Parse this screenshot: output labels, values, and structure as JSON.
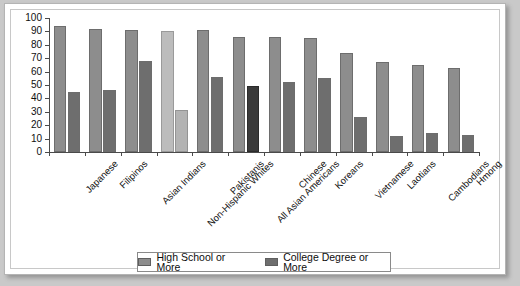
{
  "chart_data": {
    "type": "bar",
    "title": "",
    "xlabel": "",
    "ylabel": "",
    "ylim": [
      0,
      100
    ],
    "ytick_step": 10,
    "yticks": [
      "0",
      "10",
      "20",
      "30",
      "40",
      "50",
      "60",
      "70",
      "80",
      "90",
      "100"
    ],
    "grid": false,
    "legend_position": "bottom",
    "categories": [
      "Japanese",
      "Filipinos",
      "Asian Indians",
      "Non-Hispanic Whites",
      "Pakistanis",
      "All Asian Americans",
      "Chinese",
      "Koreans",
      "Vietnamese",
      "Laotians",
      "Cambodians",
      "Hmong"
    ],
    "series": [
      {
        "name": "High School or More",
        "color": "#8d8d8d",
        "values": [
          94,
          92,
          91,
          90,
          91,
          86,
          86,
          85,
          74,
          67,
          65,
          63
        ]
      },
      {
        "name": "College Degree or More",
        "color": "#6e6e6e",
        "values": [
          45,
          46,
          68,
          31,
          56,
          49,
          52,
          55,
          26,
          12,
          14,
          13
        ]
      }
    ]
  },
  "legend": {
    "items": [
      {
        "label": "High School or More",
        "color": "#8d8d8d"
      },
      {
        "label": "College Degree or More",
        "color": "#6e6e6e"
      }
    ]
  }
}
